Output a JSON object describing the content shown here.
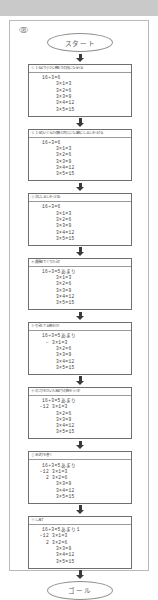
{
  "top_band": {
    "color": "#c9c9c9"
  },
  "page": {
    "figure_label": "〈図〉",
    "border_color": "#b9b9b9"
  },
  "flow": {
    "start_label": "スタート",
    "goal_label": "ゴール",
    "steps": [
      {
        "header": "① １６より小さい数を３の段にならべる",
        "lines": [
          {
            "class": "quotient",
            "text": "16÷3=6"
          },
          {
            "class": "table",
            "text": "3×1=3"
          },
          {
            "class": "table",
            "text": "3×2=6"
          },
          {
            "class": "table",
            "text": "3×3=9"
          },
          {
            "class": "table",
            "text": "3×4=12"
          },
          {
            "class": "table",
            "text": "3×5=15"
          }
        ]
      },
      {
        "header": "② １６のいくらかの数と同じになる数にしるしをつける",
        "lines": [
          {
            "class": "quotient",
            "text": "16÷3=6"
          },
          {
            "class": "table",
            "text": "3×1=3"
          },
          {
            "class": "table",
            "text": "3×2=6"
          },
          {
            "class": "table",
            "text": "3×3=9"
          },
          {
            "class": "table",
            "text": "3×4=12"
          },
          {
            "class": "table",
            "text": "3×5=15"
          }
        ]
      },
      {
        "header": "③ 次にしるしをつける",
        "lines": [
          {
            "class": "quotient",
            "text": "16÷3=6"
          },
          {
            "class": "table",
            "text": "3×1=3"
          },
          {
            "class": "table",
            "text": "3×2=6"
          },
          {
            "class": "table",
            "text": "3×3=9"
          },
          {
            "class": "table",
            "text": "3×4=12"
          },
          {
            "class": "table",
            "text": "3×5=15"
          }
        ]
      },
      {
        "header": "④ 最後までくりかえす",
        "lines": [
          {
            "class": "quotient",
            "text": "16÷3=5あまり"
          },
          {
            "class": "table",
            "text": "3×1=3"
          },
          {
            "class": "table",
            "text": "3×2=6"
          },
          {
            "class": "table",
            "text": "3×3=9"
          },
          {
            "class": "table",
            "text": "3×4=12"
          },
          {
            "class": "table",
            "text": "3×5=15"
          }
        ]
      },
      {
        "header": "⑤ 引きたてる数をひく",
        "lines": [
          {
            "class": "quotient",
            "text": "16÷3=5あまり"
          },
          {
            "class": "sub",
            "note": "−",
            "text": "3×1=3"
          },
          {
            "class": "table",
            "text": "3×2=6"
          },
          {
            "class": "table",
            "text": "3×3=9"
          },
          {
            "class": "table",
            "text": "3×4=12"
          },
          {
            "class": "table",
            "text": "3×5=15"
          }
        ]
      },
      {
        "header": "⑥ のこりをひいたあまりの数をうつす",
        "lines": [
          {
            "class": "quotient",
            "text": "16÷3=5あまり"
          },
          {
            "class": "sub",
            "note": "−12",
            "text": "3×1=3"
          },
          {
            "class": "table",
            "text": "3×2=6"
          },
          {
            "class": "table",
            "text": "3×3=9"
          },
          {
            "class": "table",
            "text": "3×4=12"
          },
          {
            "class": "table",
            "text": "3×5=15"
          }
        ]
      },
      {
        "header": "⑦ あまりを書く",
        "lines": [
          {
            "class": "quotient",
            "text": "16÷3=5あまり"
          },
          {
            "class": "sub",
            "note": "−12",
            "text": "3×1=3"
          },
          {
            "class": "sub",
            "note": "2",
            "text": "3×2=6"
          },
          {
            "class": "table",
            "text": "3×3=9"
          },
          {
            "class": "table",
            "text": "3×4=12"
          },
          {
            "class": "table",
            "text": "3×5=15"
          }
        ]
      },
      {
        "header": "⑧ しあげ",
        "lines": [
          {
            "class": "quotient",
            "text": "16÷3=5あまり1"
          },
          {
            "class": "sub",
            "note": "−12",
            "text": "3×1=3"
          },
          {
            "class": "sub",
            "note": "2",
            "text": "3×2=6"
          },
          {
            "class": "table",
            "text": "3×3=9"
          },
          {
            "class": "table",
            "text": "3×4=12"
          },
          {
            "class": "table",
            "text": "3×5=15"
          }
        ]
      }
    ]
  }
}
